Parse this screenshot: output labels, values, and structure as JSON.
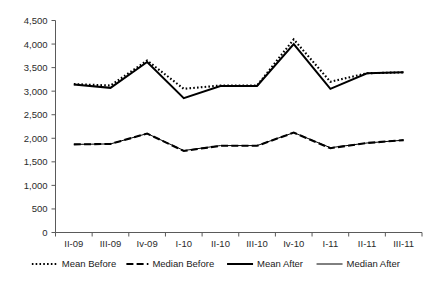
{
  "chart_data": {
    "type": "line",
    "title": "",
    "xlabel": "",
    "ylabel": "",
    "ylim": [
      0,
      4500
    ],
    "ytick_step": 500,
    "grid": false,
    "legend_position": "bottom",
    "categories": [
      "II-09",
      "III-09",
      "Iv-09",
      "I-10",
      "II-10",
      "III-10",
      "Iv-10",
      "I-11",
      "II-11",
      "III-11"
    ],
    "ytick_labels": [
      "0",
      "500",
      "1,000",
      "1,500",
      "2,000",
      "2,500",
      "3,000",
      "3,500",
      "4,000",
      "4,500"
    ],
    "ytick_values": [
      0,
      500,
      1000,
      1500,
      2000,
      2500,
      3000,
      3500,
      4000,
      4500
    ],
    "series": [
      {
        "name": "Mean Before",
        "style": "dotted",
        "color": "#000000",
        "values": [
          3150,
          3120,
          3650,
          3050,
          3120,
          3120,
          4100,
          3200,
          3380,
          3400
        ]
      },
      {
        "name": "Median Before",
        "style": "dashed",
        "color": "#000000",
        "values": [
          1870,
          1880,
          2100,
          1730,
          1840,
          1840,
          2120,
          1790,
          1900,
          1960
        ]
      },
      {
        "name": "Mean After",
        "style": "solid-thick",
        "color": "#000000",
        "values": [
          3140,
          3070,
          3620,
          2850,
          3110,
          3110,
          4000,
          3050,
          3380,
          3400
        ]
      },
      {
        "name": "Median After",
        "style": "solid-thin",
        "color": "#000000",
        "values": [
          1870,
          1880,
          2100,
          1740,
          1845,
          1845,
          2120,
          1800,
          1900,
          1960
        ]
      }
    ]
  },
  "legend": {
    "items": [
      {
        "label": "Mean Before",
        "marker": "dotted-line-marker"
      },
      {
        "label": "Median Before",
        "marker": "dashed-line-marker"
      },
      {
        "label": "Mean After",
        "marker": "thick-solid-line-marker"
      },
      {
        "label": "Median After",
        "marker": "thin-solid-line-marker"
      }
    ]
  }
}
